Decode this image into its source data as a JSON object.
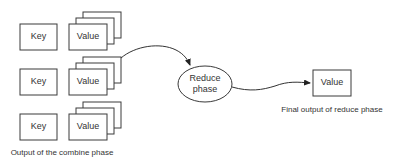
{
  "diagram": {
    "rows": [
      {
        "key": "Key",
        "value": "Value"
      },
      {
        "key": "Key",
        "value": "Value"
      },
      {
        "key": "Key",
        "value": "Value"
      }
    ],
    "combine_caption": "Output of the combine phase",
    "reduce_node": {
      "line1": "Reduce",
      "line2": "phase"
    },
    "final_value": "Value",
    "final_caption": "Final output of reduce phase",
    "colors": {
      "stroke": "#3a3a3a",
      "text": "#333333",
      "background": "#ffffff"
    }
  }
}
